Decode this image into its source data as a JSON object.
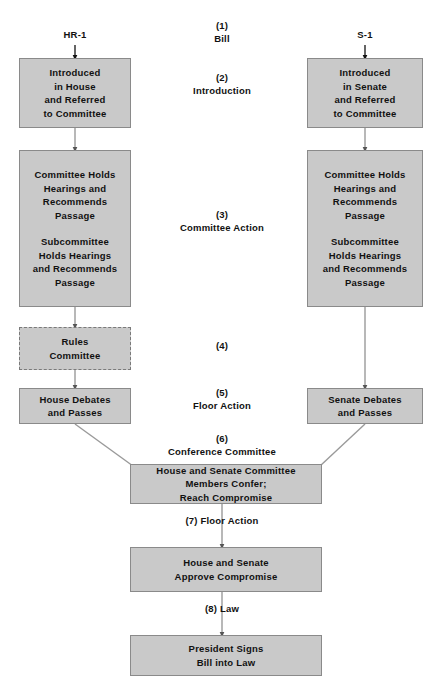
{
  "diagram": {
    "colors": {
      "box_fill": "#c9c9c9",
      "box_border": "#8a8a8a",
      "connector": "#9a9a9a",
      "text": "#111111",
      "background": "#ffffff"
    },
    "entry_labels": {
      "house": "HR-1",
      "senate": "S-1"
    },
    "stage_labels": [
      {
        "number": "(1)",
        "name": "Bill"
      },
      {
        "number": "(2)",
        "name": "Introduction"
      },
      {
        "number": "(3)",
        "name": "Committee Action"
      },
      {
        "number": "(4)",
        "name": ""
      },
      {
        "number": "(5)",
        "name": "Floor Action"
      },
      {
        "number": "(6)",
        "name": "Conference Committee"
      },
      {
        "number": "(7) Floor Action",
        "name": ""
      },
      {
        "number": "(8) Law",
        "name": ""
      }
    ],
    "house_boxes": [
      {
        "text": "Introduced\nin House\nand Referred\nto Committee"
      },
      {
        "text": "Committee Holds\nHearings and\nRecommends\nPassage",
        "text2": "Subcommittee\nHolds Hearings\nand Recommends\nPassage"
      },
      {
        "text": "Rules\nCommittee"
      },
      {
        "text": "House Debates\nand Passes"
      }
    ],
    "senate_boxes": [
      {
        "text": "Introduced\nin Senate\nand Referred\nto Committee"
      },
      {
        "text": "Committee Holds\nHearings and\nRecommends\nPassage",
        "text2": "Subcommittee\nHolds Hearings\nand Recommends\nPassage"
      },
      {
        "text": "Senate Debates\nand Passes"
      }
    ],
    "center_boxes": [
      {
        "text": "House and Senate Committee\nMembers Confer;\nReach Compromise"
      },
      {
        "text": "House and Senate\nApprove Compromise"
      },
      {
        "text": "President Signs\nBill into Law"
      }
    ]
  }
}
